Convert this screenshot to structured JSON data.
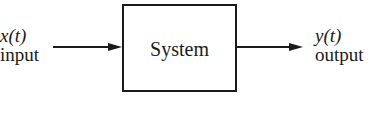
{
  "diagram": {
    "input": {
      "signal": "x(t)",
      "label": "input"
    },
    "block": {
      "label": "System"
    },
    "output": {
      "signal": "y(t)",
      "label": "output"
    },
    "colors": {
      "stroke": "#1a1a1a",
      "background": "#ffffff"
    }
  }
}
